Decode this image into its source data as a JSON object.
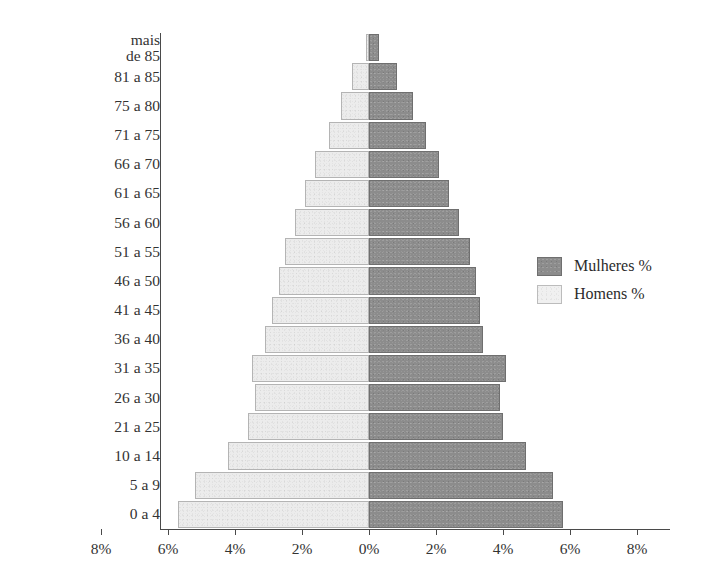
{
  "chart_data": {
    "type": "bar",
    "subtype": "population-pyramid",
    "title": "",
    "xlabel": "",
    "ylabel": "",
    "orientation": "horizontal-diverging",
    "grid": false,
    "legend_position": "right",
    "xlim": [
      -8,
      8
    ],
    "xtick_values": [
      -8,
      -6,
      -4,
      -2,
      0,
      2,
      4,
      6,
      8
    ],
    "xtick_labels": [
      "8%",
      "6%",
      "4%",
      "2%",
      "0%",
      "2%",
      "4%",
      "6%",
      "8%"
    ],
    "categories": [
      "mais\nde 85",
      "81 a 85",
      "75 a 80",
      "71 a 75",
      "66 a 70",
      "61 a 65",
      "56 a 60",
      "51 a 55",
      "46 a 50",
      "41 a 45",
      "36 a 40",
      "31 a 35",
      "26 a 30",
      "21 a 25",
      "10 a 14",
      "5 a 9",
      "0 a 4"
    ],
    "series": [
      {
        "name": "Homens %",
        "side": "left",
        "color": "#ececec",
        "values": [
          0.1,
          0.5,
          0.85,
          1.2,
          1.6,
          1.9,
          2.2,
          2.5,
          2.7,
          2.9,
          3.1,
          3.5,
          3.4,
          3.6,
          4.2,
          5.2,
          5.7
        ]
      },
      {
        "name": "Mulheres %",
        "side": "right",
        "color": "#8c8c8c",
        "values": [
          0.3,
          0.85,
          1.3,
          1.7,
          2.1,
          2.4,
          2.7,
          3.0,
          3.2,
          3.3,
          3.4,
          4.1,
          3.9,
          4.0,
          4.7,
          5.5,
          5.8
        ]
      }
    ]
  },
  "legend": {
    "items": [
      {
        "label": "Mulheres %",
        "swatch": "dark"
      },
      {
        "label": "Homens %",
        "swatch": "light"
      }
    ]
  },
  "colors": {
    "female": "#8c8c8c",
    "male": "#ececec",
    "axis": "#4a4a4a",
    "text": "#2b2b2b",
    "background": "#ffffff"
  }
}
